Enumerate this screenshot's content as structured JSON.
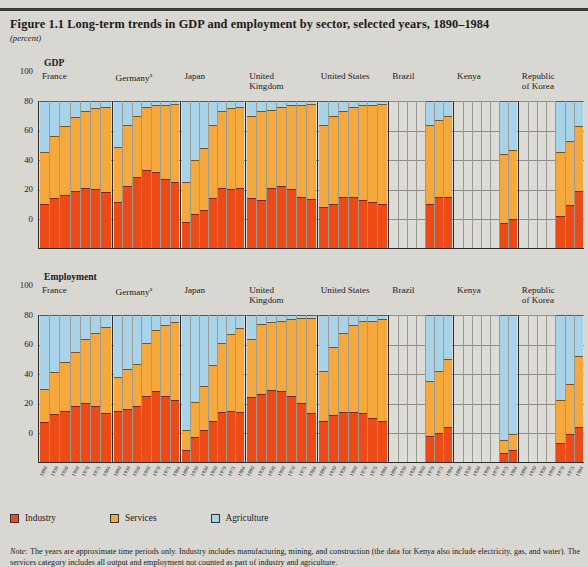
{
  "figure": {
    "title": "Figure 1.1  Long-term trends in GDP and employment by sector, selected years, 1890–1984",
    "unit": "(percent)",
    "note_label": "Note:",
    "note_text": "The years are approximate time periods only. Industry includes manufacturing, mining, and construction (the data for Kenya also include electricity, gas, and water). The services category includes all output and employment not counted as part of industry and agriculture."
  },
  "legend": {
    "items": [
      {
        "label": "Industry",
        "color": "#ec4b18",
        "icon": "legend-swatch-industry"
      },
      {
        "label": "Services",
        "color": "#f5a83c",
        "icon": "legend-swatch-services"
      },
      {
        "label": "Agriculture",
        "color": "#a9d3e8",
        "icon": "legend-swatch-agriculture"
      }
    ]
  },
  "axis": {
    "yticks": [
      "100",
      "80",
      "60",
      "40",
      "20",
      "0"
    ],
    "ylim": [
      0,
      100
    ]
  },
  "chart_data": {
    "type": "bar",
    "title": "Long-term trends in GDP and employment by sector, selected years, 1890–1984",
    "subtitle": "(percent)",
    "xlabel": "",
    "ylabel": "percent",
    "ylim": [
      0,
      100
    ],
    "grid": true,
    "legend_position": "bottom-left",
    "stacked": true,
    "series_order": [
      "Industry",
      "Services",
      "Agriculture"
    ],
    "series_colors": {
      "Industry": "#ec4b18",
      "Services": "#f5a83c",
      "Agriculture": "#a9d3e8"
    },
    "categories": [
      "1890",
      "1930",
      "1950",
      "1960",
      "1970",
      "1975",
      "1984"
    ],
    "blocks": [
      {
        "name": "GDP",
        "panels": [
          {
            "country": "France",
            "superscript": "",
            "years": [
              "1890",
              "1930",
              "1950",
              "1960",
              "1970",
              "1975",
              "1984"
            ],
            "industry": [
              30,
              34,
              36,
              39,
              41,
              40,
              38
            ],
            "services": [
              35,
              42,
              47,
              50,
              52,
              55,
              58
            ],
            "agriculture": [
              35,
              24,
              17,
              11,
              7,
              5,
              4
            ]
          },
          {
            "country": "Germany",
            "superscript": "a",
            "years": [
              "1890",
              "1930",
              "1950",
              "1960",
              "1970",
              "1975",
              "1984"
            ],
            "industry": [
              31,
              42,
              48,
              53,
              52,
              47,
              45
            ],
            "services": [
              38,
              42,
              42,
              43,
              45,
              50,
              53
            ],
            "agriculture": [
              31,
              16,
              10,
              4,
              3,
              3,
              2
            ]
          },
          {
            "country": "Japan",
            "superscript": "",
            "years": [
              "1890",
              "1930",
              "1950",
              "1960",
              "1970",
              "1975",
              "1984"
            ],
            "industry": [
              18,
              23,
              26,
              34,
              41,
              40,
              41
            ],
            "services": [
              27,
              37,
              42,
              50,
              52,
              55,
              55
            ],
            "agriculture": [
              55,
              40,
              32,
              16,
              7,
              5,
              4
            ]
          },
          {
            "country": "United Kingdom",
            "superscript": "",
            "years": [
              "1890",
              "1930",
              "1950",
              "1960",
              "1970",
              "1975",
              "1984"
            ],
            "industry": [
              34,
              33,
              41,
              42,
              40,
              35,
              33
            ],
            "services": [
              56,
              60,
              53,
              54,
              57,
              62,
              65
            ],
            "agriculture": [
              10,
              7,
              6,
              4,
              3,
              3,
              2
            ]
          },
          {
            "country": "United States",
            "superscript": "",
            "years": [
              "1890",
              "1930",
              "1950",
              "1960",
              "1970",
              "1975",
              "1984"
            ],
            "industry": [
              28,
              30,
              35,
              35,
              33,
              31,
              30
            ],
            "services": [
              56,
              60,
              58,
              61,
              64,
              66,
              68
            ],
            "agriculture": [
              16,
              10,
              7,
              4,
              3,
              3,
              2
            ]
          },
          {
            "country": "Brazil",
            "superscript": "",
            "years": [
              "1890",
              "1930",
              "1950",
              "1960",
              "1970",
              "1975",
              "1984"
            ],
            "industry": [
              null,
              null,
              null,
              null,
              30,
              35,
              35
            ],
            "services": [
              null,
              null,
              null,
              null,
              54,
              52,
              55
            ],
            "agriculture": [
              null,
              null,
              null,
              null,
              16,
              13,
              10
            ]
          },
          {
            "country": "Kenya",
            "superscript": "",
            "years": [
              "1890",
              "1930",
              "1950",
              "1960",
              "1970",
              "1975",
              "1984"
            ],
            "industry": [
              null,
              null,
              null,
              null,
              null,
              17,
              20
            ],
            "services": [
              null,
              null,
              null,
              null,
              null,
              47,
              47
            ],
            "agriculture": [
              null,
              null,
              null,
              null,
              null,
              36,
              33
            ]
          },
          {
            "country": "Republic of Korea",
            "superscript": "",
            "years": [
              "1890",
              "1930",
              "1950",
              "1960",
              "1970",
              "1975",
              "1984"
            ],
            "industry": [
              null,
              null,
              null,
              null,
              22,
              29,
              39
            ],
            "services": [
              null,
              null,
              null,
              null,
              43,
              44,
              44
            ],
            "agriculture": [
              null,
              null,
              null,
              null,
              35,
              27,
              17
            ]
          }
        ]
      },
      {
        "name": "Employment",
        "panels": [
          {
            "country": "France",
            "superscript": "",
            "years": [
              "1890",
              "1930",
              "1950",
              "1960",
              "1970",
              "1975",
              "1984"
            ],
            "industry": [
              27,
              33,
              35,
              38,
              40,
              38,
              33
            ],
            "services": [
              23,
              28,
              33,
              37,
              44,
              50,
              59
            ],
            "agriculture": [
              50,
              39,
              32,
              25,
              16,
              12,
              8
            ]
          },
          {
            "country": "Germany",
            "superscript": "a",
            "years": [
              "1890",
              "1930",
              "1950",
              "1960",
              "1970",
              "1975",
              "1984"
            ],
            "industry": [
              35,
              36,
              38,
              45,
              48,
              45,
              42
            ],
            "services": [
              23,
              27,
              29,
              36,
              42,
              48,
              53
            ],
            "agriculture": [
              42,
              37,
              33,
              19,
              10,
              7,
              5
            ]
          },
          {
            "country": "Japan",
            "superscript": "",
            "years": [
              "1890",
              "1930",
              "1950",
              "1960",
              "1970",
              "1975",
              "1984"
            ],
            "industry": [
              8,
              17,
              22,
              28,
              34,
              35,
              34
            ],
            "services": [
              14,
              24,
              30,
              38,
              47,
              52,
              57
            ],
            "agriculture": [
              78,
              59,
              48,
              34,
              19,
              13,
              9
            ]
          },
          {
            "country": "United Kingdom",
            "superscript": "",
            "years": [
              "1890",
              "1930",
              "1950",
              "1960",
              "1970",
              "1975",
              "1984"
            ],
            "industry": [
              44,
              46,
              49,
              48,
              45,
              40,
              33
            ],
            "services": [
              40,
              48,
              46,
              48,
              52,
              58,
              65
            ],
            "agriculture": [
              16,
              6,
              5,
              4,
              3,
              2,
              2
            ]
          },
          {
            "country": "United States",
            "superscript": "",
            "years": [
              "1890",
              "1930",
              "1950",
              "1960",
              "1970",
              "1975",
              "1984"
            ],
            "industry": [
              28,
              32,
              34,
              34,
              33,
              30,
              28
            ],
            "services": [
              34,
              46,
              54,
              59,
              63,
              66,
              69
            ],
            "agriculture": [
              38,
              22,
              12,
              7,
              4,
              4,
              3
            ]
          },
          {
            "country": "Brazil",
            "superscript": "",
            "years": [
              "1890",
              "1930",
              "1950",
              "1960",
              "1970",
              "1975",
              "1984"
            ],
            "industry": [
              null,
              null,
              null,
              null,
              18,
              20,
              24
            ],
            "services": [
              null,
              null,
              null,
              null,
              37,
              42,
              46
            ],
            "agriculture": [
              null,
              null,
              null,
              null,
              45,
              38,
              30
            ]
          },
          {
            "country": "Kenya",
            "superscript": "",
            "years": [
              "1890",
              "1930",
              "1950",
              "1960",
              "1970",
              "1975",
              "1984"
            ],
            "industry": [
              null,
              null,
              null,
              null,
              null,
              6,
              8
            ],
            "services": [
              null,
              null,
              null,
              null,
              null,
              9,
              11
            ],
            "agriculture": [
              null,
              null,
              null,
              null,
              null,
              85,
              81
            ]
          },
          {
            "country": "Republic of Korea",
            "superscript": "",
            "years": [
              "1890",
              "1930",
              "1950",
              "1960",
              "1970",
              "1975",
              "1984"
            ],
            "industry": [
              null,
              null,
              null,
              null,
              13,
              19,
              24
            ],
            "services": [
              null,
              null,
              null,
              null,
              29,
              34,
              48
            ],
            "agriculture": [
              null,
              null,
              null,
              null,
              58,
              47,
              28
            ]
          }
        ]
      }
    ]
  }
}
